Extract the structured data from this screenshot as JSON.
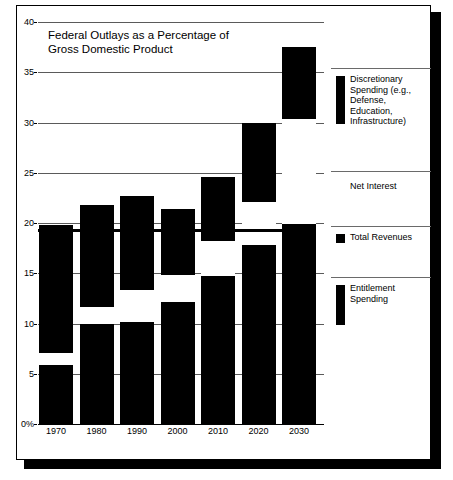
{
  "chart_data": {
    "type": "bar",
    "title": "Federal Outlays as a\nPercentage of Gross\nDomestic Product",
    "xlabel": "",
    "ylabel": "",
    "ylim": [
      0,
      40
    ],
    "ytick_labels": [
      "0%",
      "5",
      "10",
      "15",
      "20",
      "25",
      "30",
      "35",
      "40"
    ],
    "ytick_values": [
      0,
      5,
      10,
      15,
      20,
      25,
      30,
      35,
      40
    ],
    "grid": true,
    "stacked": true,
    "legend_position": "right",
    "categories": [
      "1970",
      "1980",
      "1990",
      "2000",
      "2010",
      "2020",
      "2030"
    ],
    "series": [
      {
        "name": "Entitlement Spending",
        "values": [
          5.9,
          10.0,
          10.1,
          12.1,
          14.7,
          17.8,
          19.9
        ]
      },
      {
        "name": "Net Interest",
        "values": [
          1.4,
          1.8,
          3.4,
          2.9,
          3.7,
          4.5,
          10.6
        ]
      },
      {
        "name": "Discretionary Spending (e.g., Defense, Education, Infrastructure)",
        "values": [
          12.5,
          10.0,
          9.2,
          6.4,
          6.2,
          7.7,
          7.0
        ]
      }
    ],
    "totals": [
      19.8,
      21.8,
      22.7,
      21.4,
      24.6,
      30.0,
      37.5
    ],
    "total_revenues_line": 19.3,
    "total_revenues_name": "Total Revenues",
    "annotations": []
  },
  "legend": {
    "items": [
      {
        "label": "Discretionary\nSpending (e.g.,\nDefense,\nEducation,\nInfrastructure)",
        "color": "#000000"
      },
      {
        "label": "Net Interest",
        "color": "#ffffff"
      },
      {
        "label": "Total Revenues",
        "color": "#000000"
      },
      {
        "label": "Entitlement\nSpending",
        "color": "#000000"
      }
    ]
  },
  "colors": {
    "discretionary": "#000000",
    "net_interest": "#ffffff",
    "entitlement": "#000000",
    "revenues_line": "#000000",
    "gridline": "#5a5a5a",
    "background": "#ffffff"
  }
}
